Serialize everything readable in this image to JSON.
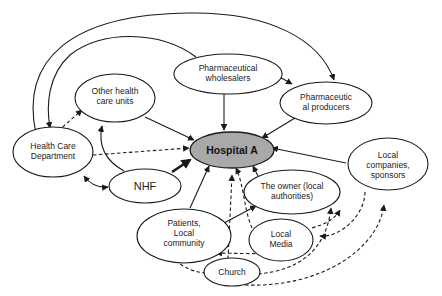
{
  "diagram": {
    "type": "stakeholder-network",
    "center_node": "Hospital A",
    "nodes": [
      {
        "id": "hospital",
        "lines": [
          "Hospital A"
        ]
      },
      {
        "id": "wholesalers",
        "lines": [
          "Pharmaceutical",
          "wholesalers"
        ]
      },
      {
        "id": "producers",
        "lines": [
          "Pharmaceutic",
          "al producers"
        ]
      },
      {
        "id": "other_units",
        "lines": [
          "Other health",
          "care units"
        ]
      },
      {
        "id": "hcd",
        "lines": [
          "Health Care",
          "Department"
        ]
      },
      {
        "id": "nhf",
        "lines": [
          "NHF"
        ]
      },
      {
        "id": "owner",
        "lines": [
          "The owner (local",
          "authorities)"
        ]
      },
      {
        "id": "companies",
        "lines": [
          "Local",
          "companies,",
          "sponsors"
        ]
      },
      {
        "id": "patients",
        "lines": [
          "Patients,",
          "Local",
          "community"
        ]
      },
      {
        "id": "media",
        "lines": [
          "Local",
          "Media"
        ]
      },
      {
        "id": "church",
        "lines": [
          "Church"
        ]
      }
    ],
    "edges": [
      {
        "from": "wholesalers",
        "to": "hospital",
        "style": "solid"
      },
      {
        "from": "wholesalers",
        "to": "producers",
        "style": "solid"
      },
      {
        "from": "producers",
        "to": "hospital",
        "style": "solid"
      },
      {
        "from": "other_units",
        "to": "hospital",
        "style": "solid"
      },
      {
        "from": "hcd",
        "to": "hospital",
        "style": "dashed"
      },
      {
        "from": "hcd",
        "to": "other_units",
        "style": "dashed"
      },
      {
        "from": "hcd",
        "to": "wholesalers",
        "style": "solid"
      },
      {
        "from": "hcd",
        "to": "producers",
        "style": "solid"
      },
      {
        "from": "hcd",
        "to": "nhf",
        "style": "solid",
        "bidirectional": true
      },
      {
        "from": "nhf",
        "to": "other_units",
        "style": "solid"
      },
      {
        "from": "nhf",
        "to": "hospital",
        "style": "thick"
      },
      {
        "from": "companies",
        "to": "hospital",
        "style": "solid"
      },
      {
        "from": "owner",
        "to": "hospital",
        "style": "solid"
      },
      {
        "from": "patients",
        "to": "hospital",
        "style": "solid"
      },
      {
        "from": "patients",
        "to": "owner",
        "style": "solid"
      },
      {
        "from": "patients",
        "to": "media",
        "style": "dashed",
        "bidirectional": true
      },
      {
        "from": "media",
        "to": "hospital",
        "style": "dashed"
      },
      {
        "from": "media",
        "to": "owner",
        "style": "dashed"
      },
      {
        "from": "media",
        "to": "companies",
        "style": "dashed"
      },
      {
        "from": "church",
        "to": "hospital",
        "style": "dashed"
      },
      {
        "from": "church",
        "to": "patients",
        "style": "dashed"
      },
      {
        "from": "church",
        "to": "owner",
        "style": "dashed"
      },
      {
        "from": "church",
        "to": "companies",
        "style": "dashed"
      }
    ]
  },
  "labels": {
    "hospital": "Hospital A",
    "wholesalers_1": "Pharmaceutical",
    "wholesalers_2": "wholesalers",
    "producers_1": "Pharmaceutic",
    "producers_2": "al producers",
    "other_units_1": "Other health",
    "other_units_2": "care units",
    "hcd_1": "Health Care",
    "hcd_2": "Department",
    "nhf": "NHF",
    "owner_1": "The owner (local",
    "owner_2": "authorities)",
    "companies_1": "Local",
    "companies_2": "companies,",
    "companies_3": "sponsors",
    "patients_1": "Patients,",
    "patients_2": "Local",
    "patients_3": "community",
    "media_1": "Local",
    "media_2": "Media",
    "church": "Church"
  },
  "colors": {
    "center_fill": "#a9a9a9",
    "stroke": "#1a1a1a",
    "background": "#ffffff"
  }
}
